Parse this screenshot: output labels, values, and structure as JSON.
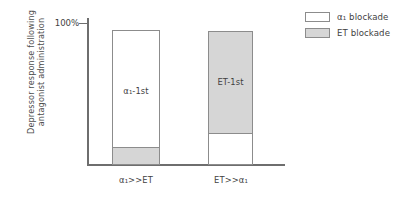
{
  "chart_data": {
    "type": "bar",
    "title": "",
    "subtitle": "",
    "xlabel": "",
    "ylabel_line1": "Depressor response following",
    "ylabel_line2": "antagonist administration",
    "ylim": [
      0,
      100
    ],
    "yticks": [
      "100%"
    ],
    "grid": false,
    "legend_position": "top-right",
    "categories": [
      "α₁>>ET",
      "ET>>α₁"
    ],
    "series": [
      {
        "name": "α₁ blockade",
        "color": "#ffffff",
        "values": [
          87,
          24
        ]
      },
      {
        "name": "ET blockade",
        "color": "#d6d6d6",
        "values": [
          13,
          76
        ]
      }
    ],
    "annotations": [
      {
        "text": "α₁-1st",
        "category": "α₁>>ET"
      },
      {
        "text": "ET-1st",
        "category": "ET>>α₁"
      }
    ]
  },
  "axes": {
    "y_tick_label": "100%",
    "y_title_line1": "Depressor response following",
    "y_title_line2": "antagonist administration"
  },
  "bars": [
    {
      "category_label": "α₁>>ET",
      "inner_label": "α₁-1st",
      "top_segment": "α₁ blockade",
      "bottom_segment": "ET blockade",
      "top_value": 87,
      "bottom_value": 13
    },
    {
      "category_label": "ET>>α₁",
      "inner_label": "ET-1st",
      "top_segment": "ET blockade",
      "bottom_segment": "α₁ blockade",
      "top_value": 76,
      "bottom_value": 24
    }
  ],
  "legend": {
    "items": [
      {
        "label": "α₁ blockade",
        "swatch": "white"
      },
      {
        "label": "ET blockade",
        "swatch": "gray"
      }
    ]
  },
  "colors": {
    "gray_fill": "#d6d6d6",
    "white_fill": "#ffffff",
    "border": "#8c8c8c",
    "axis": "#6e6e6e",
    "text": "#3f3f3f"
  }
}
